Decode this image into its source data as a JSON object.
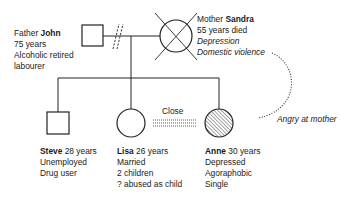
{
  "father": {
    "role": "Father",
    "name": "John",
    "lines": [
      "75 years",
      "Alcoholic retired",
      "labourer"
    ]
  },
  "mother": {
    "role": "Mother",
    "name": "Sandra",
    "lines": [
      "55 years died"
    ],
    "italic_lines": [
      "Depression",
      "Domestic violence"
    ]
  },
  "relationship": {
    "marriage": "separated/divorced"
  },
  "children": [
    {
      "name": "Steve",
      "age": "28 years",
      "lines": [
        "Unemployed",
        "Drug user"
      ],
      "sex": "male"
    },
    {
      "name": "Lisa",
      "age": "26 years",
      "lines": [
        "Married",
        "2 children",
        "? abused as child"
      ],
      "sex": "female"
    },
    {
      "name": "Anne",
      "age": "30 years",
      "lines": [
        "Depressed",
        "Agoraphobic",
        "Single"
      ],
      "sex": "female",
      "shaded": true
    }
  ],
  "close_label": "Close",
  "conflict_label": "Angry at mother"
}
